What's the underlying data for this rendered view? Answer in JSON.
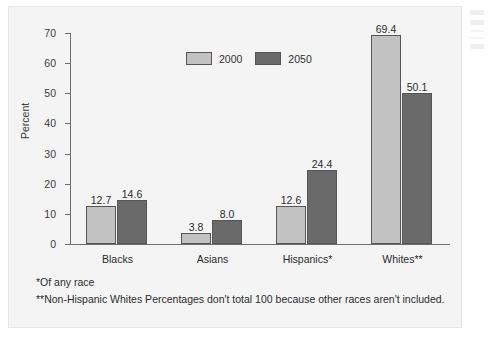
{
  "chart_data": {
    "type": "bar",
    "title": "",
    "xlabel": "",
    "ylabel": "Percent",
    "ylim": [
      0,
      70
    ],
    "yticks": [
      0,
      10,
      20,
      30,
      40,
      50,
      60,
      70
    ],
    "grid": false,
    "legend_position": "top-center",
    "categories": [
      "Blacks",
      "Asians",
      "Hispanics*",
      "Whites**"
    ],
    "series": [
      {
        "name": "2000",
        "color": "#c2c2c2",
        "values": [
          12.7,
          3.8,
          12.6,
          69.4
        ]
      },
      {
        "name": "2050",
        "color": "#6a6a6a",
        "values": [
          14.6,
          8.0,
          24.4,
          50.1
        ]
      }
    ],
    "value_labels": {
      "s0": [
        "12.7",
        "3.8",
        "12.6",
        "69.4"
      ],
      "s1": [
        "14.6",
        "8.0",
        "24.4",
        "50.1"
      ]
    },
    "tick_labels": [
      "0",
      "10",
      "20",
      "30",
      "40",
      "50",
      "60",
      "70"
    ]
  },
  "footnotes": [
    "*Of any race",
    "**Non-Hispanic Whites Percentages don't total 100 because other races aren't included."
  ]
}
